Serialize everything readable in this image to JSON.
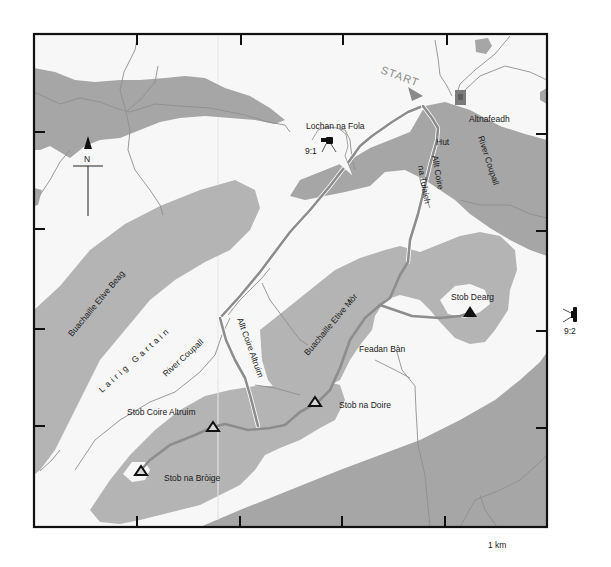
{
  "map": {
    "start_label": "START",
    "north_label": "N",
    "scale_label": "1 km",
    "colors": {
      "frame": "#111111",
      "land": "#f7f7f7",
      "terrain": "#b4b4b4",
      "route": "#8d8d8d",
      "start": "#8a8a8a"
    },
    "places": [
      {
        "id": "altnafeadh",
        "label": "Altnafeadh"
      },
      {
        "id": "lochan",
        "label": "Lochan na Fola"
      },
      {
        "id": "hut",
        "label": "Hut"
      },
      {
        "id": "allt-coire-na-tulaich-1",
        "label": "Allt Coire"
      },
      {
        "id": "allt-coire-na-tulaich-2",
        "label": "na Tulaich"
      },
      {
        "id": "river-coupall-ne",
        "label": "River Coupall"
      },
      {
        "id": "buachaille-etive-beag",
        "label": "Buachaille Etive Beag"
      },
      {
        "id": "lairig-gartain",
        "label": "Lairig Gartain"
      },
      {
        "id": "river-coupall-sw",
        "label": "River Coupall"
      },
      {
        "id": "allt-coire-altruim",
        "label": "Allt Coire Altruim"
      },
      {
        "id": "buachaille-etive-mor",
        "label": "Buachaille Etive Mòr"
      },
      {
        "id": "feadan-ban",
        "label": "Feadan Bàn"
      },
      {
        "id": "stob-dearg",
        "label": "Stob Dearg"
      },
      {
        "id": "stob-na-doire",
        "label": "Stob na Doire"
      },
      {
        "id": "stob-coire-altruim",
        "label": "Stob Coire Altruim"
      },
      {
        "id": "stob-na-broige",
        "label": "Stob na Bròige"
      }
    ],
    "photo_points": [
      {
        "id": "photo-9-1",
        "label": "9:1"
      },
      {
        "id": "photo-9-2",
        "label": "9:2"
      }
    ],
    "summits": [
      {
        "id": "stob-dearg",
        "style": "filled"
      },
      {
        "id": "stob-na-doire",
        "style": "outline"
      },
      {
        "id": "stob-coire-altruim",
        "style": "outline"
      },
      {
        "id": "stob-na-broige",
        "style": "outline"
      }
    ]
  }
}
